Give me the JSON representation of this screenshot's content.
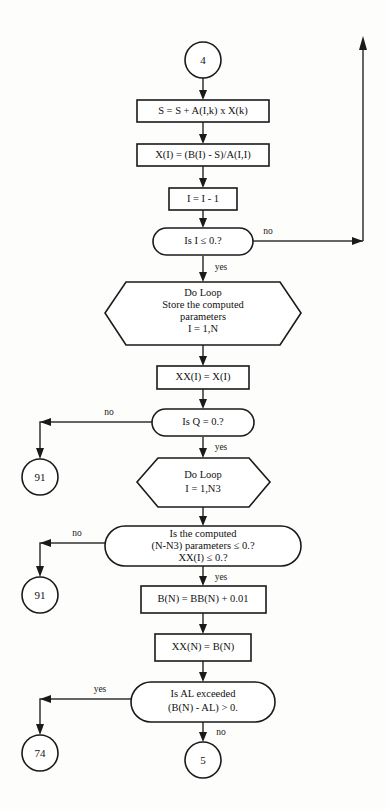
{
  "diagram": {
    "colors": {
      "background": "#fdfdfc",
      "stroke": "#1a1a1a",
      "connector": "#333333",
      "text": "#111111"
    },
    "nodes": [
      {
        "id": "term-4",
        "kind": "terminator-circle",
        "label": "4"
      },
      {
        "id": "proc-s",
        "kind": "process",
        "label": "S = S + A(I,k) x X(k)"
      },
      {
        "id": "proc-xi",
        "kind": "process",
        "label": "X(I) = (B(I) - S)/A(I,I)"
      },
      {
        "id": "proc-dec-i",
        "kind": "process",
        "label": "I = I - 1"
      },
      {
        "id": "dec-i",
        "kind": "decision-stadium",
        "label": "Is I ≤ 0.?"
      },
      {
        "id": "loop-store",
        "kind": "hexagon",
        "lines": [
          "Do Loop",
          "Store the computed",
          "parameters",
          "I = 1,N"
        ]
      },
      {
        "id": "proc-xxi",
        "kind": "process",
        "label": "XX(I) = X(I)"
      },
      {
        "id": "dec-q",
        "kind": "decision-stadium",
        "label": "Is Q = 0.?"
      },
      {
        "id": "loop-n3",
        "kind": "hexagon",
        "lines": [
          "Do Loop",
          "I = 1,N3"
        ]
      },
      {
        "id": "dec-computed",
        "kind": "decision-stadium",
        "lines": [
          "Is the computed",
          "(N-N3) parameters ≤ 0.?",
          "XX(I) ≤ 0.?"
        ]
      },
      {
        "id": "proc-bn",
        "kind": "process",
        "label": "B(N) = BB(N) + 0.01"
      },
      {
        "id": "proc-xxn",
        "kind": "process",
        "label": "XX(N) = B(N)"
      },
      {
        "id": "dec-al",
        "kind": "decision-stadium",
        "lines": [
          "Is AL exceeded",
          "(B(N) - AL) > 0."
        ]
      },
      {
        "id": "term-91-a",
        "kind": "terminator-circle",
        "label": "91"
      },
      {
        "id": "term-91-b",
        "kind": "terminator-circle",
        "label": "91"
      },
      {
        "id": "term-74",
        "kind": "terminator-circle",
        "label": "74"
      },
      {
        "id": "term-5",
        "kind": "terminator-circle",
        "label": "5"
      }
    ],
    "edge_labels": {
      "i_no": "no",
      "i_yes": "yes",
      "q_no": "no",
      "q_yes": "yes",
      "computed_no": "no",
      "computed_yes": "yes",
      "al_yes": "yes",
      "al_no": "no"
    }
  }
}
